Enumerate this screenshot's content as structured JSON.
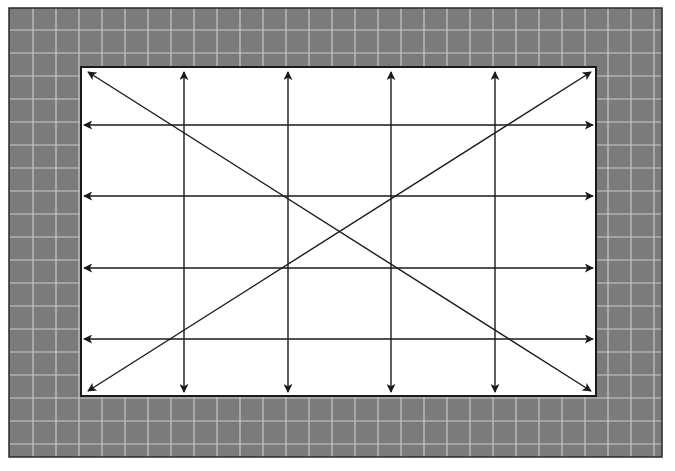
{
  "diagram": {
    "canvas": {
      "width": 675,
      "height": 471
    },
    "colors": {
      "frame_fill": "#7b7b7b",
      "frame_grid": "#c9c9c9",
      "frame_border": "#2a2a2a",
      "inner_fill": "#ffffff",
      "inner_border": "#1a1a1a",
      "arrow": "#1a1a1a"
    },
    "outer_frame": {
      "x": 9,
      "y": 8,
      "width": 653,
      "height": 449,
      "grid_spacing": 23,
      "grid_origin_x": 10,
      "grid_origin_y": 7
    },
    "inner_rect": {
      "x": 81,
      "y": 67,
      "width": 515,
      "height": 329
    },
    "vertical_arrows": [
      {
        "x": 184,
        "y1": 72,
        "y2": 392
      },
      {
        "x": 288,
        "y1": 72,
        "y2": 392
      },
      {
        "x": 391,
        "y1": 72,
        "y2": 392
      },
      {
        "x": 495,
        "y1": 72,
        "y2": 392
      }
    ],
    "horizontal_arrows": [
      {
        "y": 125,
        "x1": 84,
        "x2": 593
      },
      {
        "y": 196,
        "x1": 84,
        "x2": 593
      },
      {
        "y": 268,
        "x1": 84,
        "x2": 593
      },
      {
        "y": 339,
        "x1": 84,
        "x2": 593
      }
    ],
    "diagonal_arrows": [
      {
        "x1": 88,
        "y1": 72,
        "x2": 591,
        "y2": 391
      },
      {
        "x1": 88,
        "y1": 391,
        "x2": 591,
        "y2": 72
      }
    ],
    "caption_cut_off": ""
  }
}
